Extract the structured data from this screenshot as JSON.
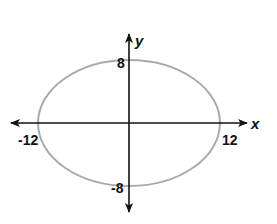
{
  "diagram": {
    "type": "ellipse-on-coordinate-axes",
    "axes": {
      "x_label": "x",
      "y_label": "y"
    },
    "ellipse": {
      "center": [
        0,
        0
      ],
      "semi_major_x": 12,
      "semi_minor_y": 8,
      "stroke_color": "#aaaaaa"
    },
    "intercept_labels": {
      "top": "8",
      "bottom": "-8",
      "left": "-12",
      "right": "12"
    },
    "colors": {
      "axis": "#111111",
      "curve": "#aaaaaa",
      "background": "#ffffff"
    }
  }
}
